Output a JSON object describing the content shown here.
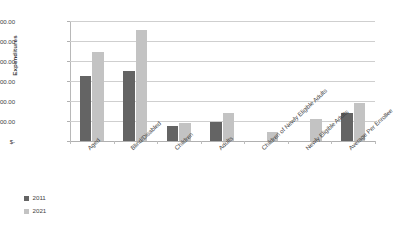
{
  "chart_data": {
    "type": "bar",
    "title": "",
    "xlabel": "",
    "ylabel": "Expenditures",
    "ylim": [
      0,
      30000
    ],
    "grid": true,
    "legend_position": "bottom-left",
    "y_tick_labels": [
      "$30,000.00",
      "$25,000.00",
      "$20,000.00",
      "$15,000.00",
      "$10,000.00",
      "$5,000.00",
      "$-"
    ],
    "y_tick_values": [
      30000,
      25000,
      20000,
      15000,
      10000,
      5000,
      0
    ],
    "categories": [
      "Aged",
      "Blind/Disabled",
      "Children",
      "Adults",
      "Children of Newly Eligible Adults",
      "Newly Eligible Adults",
      "Average Per Enrollee"
    ],
    "series": [
      {
        "name": "2011",
        "color": "#646464",
        "values": [
          16250,
          17500,
          3750,
          4750,
          0,
          0,
          7000
        ]
      },
      {
        "name": "2021",
        "color": "#c3c3c3",
        "values": [
          22250,
          27750,
          4500,
          7000,
          2250,
          5500,
          9500
        ]
      }
    ]
  },
  "legend": {
    "items": [
      {
        "label": "2011",
        "color": "#646464"
      },
      {
        "label": "2021",
        "color": "#c3c3c3"
      }
    ]
  }
}
